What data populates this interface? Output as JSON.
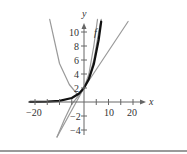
{
  "chart_data": {
    "type": "line",
    "title": "",
    "xlabel": "x",
    "ylabel": "y",
    "xlim": [
      -22,
      25
    ],
    "ylim": [
      -5,
      12
    ],
    "grid": false,
    "legend": "none (curve labeled inline with 'f')",
    "x_ticks": [
      -20,
      -15,
      -10,
      -5,
      5,
      10,
      15,
      20
    ],
    "x_tick_labels": [
      "-20",
      "10",
      "20"
    ],
    "y_ticks": [
      -4,
      -2,
      2,
      4,
      6,
      8,
      10
    ],
    "y_tick_labels": [
      "-4",
      "-2",
      "2",
      "4",
      "6",
      "8",
      "10"
    ],
    "annotations": [
      {
        "text": "f",
        "x": 4,
        "y": 10
      }
    ],
    "series": [
      {
        "name": "f",
        "style": "thick black",
        "description": "Exponential-looking curve, estimated visually; no equation shown in image",
        "points": [
          [
            -22,
            0.01
          ],
          [
            -15,
            0.05
          ],
          [
            -10,
            0.16
          ],
          [
            -5,
            0.57
          ],
          [
            -2,
            1.21
          ],
          [
            0,
            2
          ],
          [
            2,
            3.3
          ],
          [
            4,
            5.4
          ],
          [
            6,
            8.9
          ],
          [
            7,
            11.5
          ]
        ]
      },
      {
        "name": "approx-quadratic",
        "style": "gray",
        "description": "Parabola-like curve, vertex roughly at (-2.5, 1); estimated visually",
        "points": [
          [
            -14,
            12
          ],
          [
            -10,
            5.5
          ],
          [
            -6,
            2.5
          ],
          [
            -2.5,
            1
          ],
          [
            0,
            2
          ],
          [
            2,
            4
          ],
          [
            4,
            8
          ],
          [
            5.5,
            12
          ]
        ]
      },
      {
        "name": "approx-steep",
        "style": "gray",
        "description": "Steep curve running close to f; estimated visually",
        "points": [
          [
            -11,
            -5
          ],
          [
            -8,
            -2.5
          ],
          [
            -5,
            -0.3
          ],
          [
            -2,
            1
          ],
          [
            0,
            2
          ],
          [
            2,
            3.5
          ],
          [
            4,
            6
          ],
          [
            6,
            10
          ],
          [
            7,
            12
          ]
        ]
      },
      {
        "name": "approx-line",
        "style": "gray",
        "description": "Straight line through about (0,2), slope about 0.5; estimated visually",
        "points": [
          [
            -11,
            -5
          ],
          [
            0,
            2
          ],
          [
            18,
            11.5
          ]
        ]
      }
    ]
  },
  "labels": {
    "x_axis": "x",
    "y_axis": "y",
    "curve_f": "f",
    "x_ticks": {
      "neg20": "−20",
      "pos10": "10",
      "pos20": "20"
    },
    "y_ticks": {
      "p10": "10",
      "p8": "8",
      "p6": "6",
      "p4": "4",
      "p2": "2",
      "n2": "−2",
      "n4": "−4"
    }
  }
}
